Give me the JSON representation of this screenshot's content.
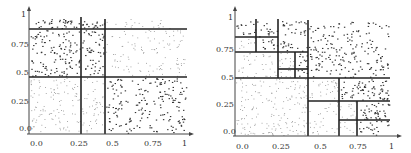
{
  "figures": [
    {
      "id": "left",
      "origin": [
        29,
        134
      ],
      "scale": [
        158,
        116
      ],
      "y_ticks": [
        {
          "label": "1",
          "x": 21,
          "y": 17
        },
        {
          "label": "0.75",
          "x": 11,
          "y": 47
        },
        {
          "label": "0.5",
          "x": 16,
          "y": 75
        },
        {
          "label": "0.25",
          "x": 11,
          "y": 104
        },
        {
          "label": "0.0",
          "x": 19,
          "y": 131
        }
      ],
      "x_ticks": [
        {
          "label": "0.0",
          "x": 30,
          "y": 140
        },
        {
          "label": "0.25",
          "x": 70,
          "y": 140
        },
        {
          "label": "0.5",
          "x": 106,
          "y": 140
        },
        {
          "label": "0.75",
          "x": 144,
          "y": 140
        },
        {
          "label": "1",
          "x": 182,
          "y": 140
        }
      ],
      "lines": [
        [
          29,
          29,
          187,
          29
        ],
        [
          29,
          77,
          187,
          77
        ],
        [
          81,
          17,
          81,
          134
        ],
        [
          105,
          19,
          105,
          134
        ]
      ],
      "regions": [
        {
          "x0": 29,
          "y0": 18,
          "x1": 81,
          "y1": 29,
          "n": 35,
          "dense": true
        },
        {
          "x0": 81,
          "y0": 18,
          "x1": 105,
          "y1": 29,
          "n": 18,
          "dense": true
        },
        {
          "x0": 105,
          "y0": 18,
          "x1": 187,
          "y1": 29,
          "n": 20,
          "dense": false
        },
        {
          "x0": 29,
          "y0": 29,
          "x1": 81,
          "y1": 77,
          "n": 120,
          "dense": true
        },
        {
          "x0": 81,
          "y0": 29,
          "x1": 105,
          "y1": 77,
          "n": 55,
          "dense": true
        },
        {
          "x0": 105,
          "y0": 29,
          "x1": 187,
          "y1": 77,
          "n": 110,
          "dense": false
        },
        {
          "x0": 29,
          "y0": 77,
          "x1": 81,
          "y1": 134,
          "n": 110,
          "dense": false
        },
        {
          "x0": 81,
          "y0": 77,
          "x1": 105,
          "y1": 134,
          "n": 45,
          "dense": false
        },
        {
          "x0": 105,
          "y0": 77,
          "x1": 187,
          "y1": 134,
          "n": 190,
          "dense": true
        }
      ]
    },
    {
      "id": "right",
      "origin": [
        235,
        136
      ],
      "scale": [
        155,
        117
      ],
      "y_ticks": [
        {
          "label": "1",
          "x": 228,
          "y": 20
        },
        {
          "label": "0.75",
          "x": 216,
          "y": 52
        },
        {
          "label": "0.5",
          "x": 221,
          "y": 80
        },
        {
          "label": "0.25",
          "x": 216,
          "y": 107
        },
        {
          "label": "0.0",
          "x": 223,
          "y": 134
        }
      ],
      "x_ticks": [
        {
          "label": "0.0",
          "x": 236,
          "y": 143
        },
        {
          "label": "0.25",
          "x": 272,
          "y": 143
        },
        {
          "label": "0.5",
          "x": 314,
          "y": 143
        },
        {
          "label": "0.75",
          "x": 349,
          "y": 143
        },
        {
          "label": "1",
          "x": 389,
          "y": 143
        }
      ],
      "lines": [
        [
          256,
          19,
          256,
          52
        ],
        [
          278,
          19,
          278,
          78
        ],
        [
          308,
          20,
          308,
          136
        ],
        [
          235,
          37,
          278,
          37
        ],
        [
          235,
          52,
          308,
          52
        ],
        [
          295,
          52,
          295,
          78
        ],
        [
          278,
          69,
          308,
          69
        ],
        [
          235,
          78,
          390,
          78
        ],
        [
          339,
          78,
          339,
          136
        ],
        [
          308,
          101,
          390,
          101
        ],
        [
          357,
          101,
          357,
          136
        ],
        [
          339,
          120,
          390,
          120
        ]
      ],
      "regions": [
        {
          "x0": 235,
          "y0": 20,
          "x1": 256,
          "y1": 37,
          "n": 14,
          "dense": true
        },
        {
          "x0": 256,
          "y0": 20,
          "x1": 278,
          "y1": 52,
          "n": 28,
          "dense": true
        },
        {
          "x0": 235,
          "y0": 37,
          "x1": 256,
          "y1": 52,
          "n": 10,
          "dense": false
        },
        {
          "x0": 278,
          "y0": 20,
          "x1": 308,
          "y1": 52,
          "n": 40,
          "dense": true
        },
        {
          "x0": 235,
          "y0": 52,
          "x1": 278,
          "y1": 78,
          "n": 35,
          "dense": false
        },
        {
          "x0": 278,
          "y0": 52,
          "x1": 295,
          "y1": 69,
          "n": 14,
          "dense": false
        },
        {
          "x0": 295,
          "y0": 52,
          "x1": 308,
          "y1": 78,
          "n": 16,
          "dense": true
        },
        {
          "x0": 278,
          "y0": 69,
          "x1": 295,
          "y1": 78,
          "n": 6,
          "dense": false
        },
        {
          "x0": 308,
          "y0": 20,
          "x1": 390,
          "y1": 78,
          "n": 190,
          "dense": true
        },
        {
          "x0": 235,
          "y0": 78,
          "x1": 308,
          "y1": 136,
          "n": 170,
          "dense": false
        },
        {
          "x0": 308,
          "y0": 78,
          "x1": 339,
          "y1": 101,
          "n": 30,
          "dense": false
        },
        {
          "x0": 339,
          "y0": 78,
          "x1": 390,
          "y1": 101,
          "n": 70,
          "dense": true
        },
        {
          "x0": 308,
          "y0": 101,
          "x1": 339,
          "y1": 136,
          "n": 30,
          "dense": false
        },
        {
          "x0": 339,
          "y0": 101,
          "x1": 357,
          "y1": 120,
          "n": 14,
          "dense": false
        },
        {
          "x0": 357,
          "y0": 101,
          "x1": 390,
          "y1": 120,
          "n": 40,
          "dense": true
        },
        {
          "x0": 339,
          "y0": 120,
          "x1": 357,
          "y1": 136,
          "n": 8,
          "dense": false
        },
        {
          "x0": 357,
          "y0": 120,
          "x1": 390,
          "y1": 136,
          "n": 22,
          "dense": true
        }
      ]
    }
  ],
  "axes": {
    "left": {
      "y_axis": [
        29,
        134,
        29,
        6
      ],
      "x_axis": [
        27,
        134,
        194,
        134
      ]
    },
    "right": {
      "y_axis": [
        235,
        136,
        235,
        6
      ],
      "x_axis": [
        233,
        136,
        402,
        136
      ]
    }
  },
  "colors": {
    "line": "#222222",
    "axis": "#444444",
    "dot_dense": "#333333",
    "dot_sparse": "#8a8a8a",
    "text": "#333333"
  }
}
